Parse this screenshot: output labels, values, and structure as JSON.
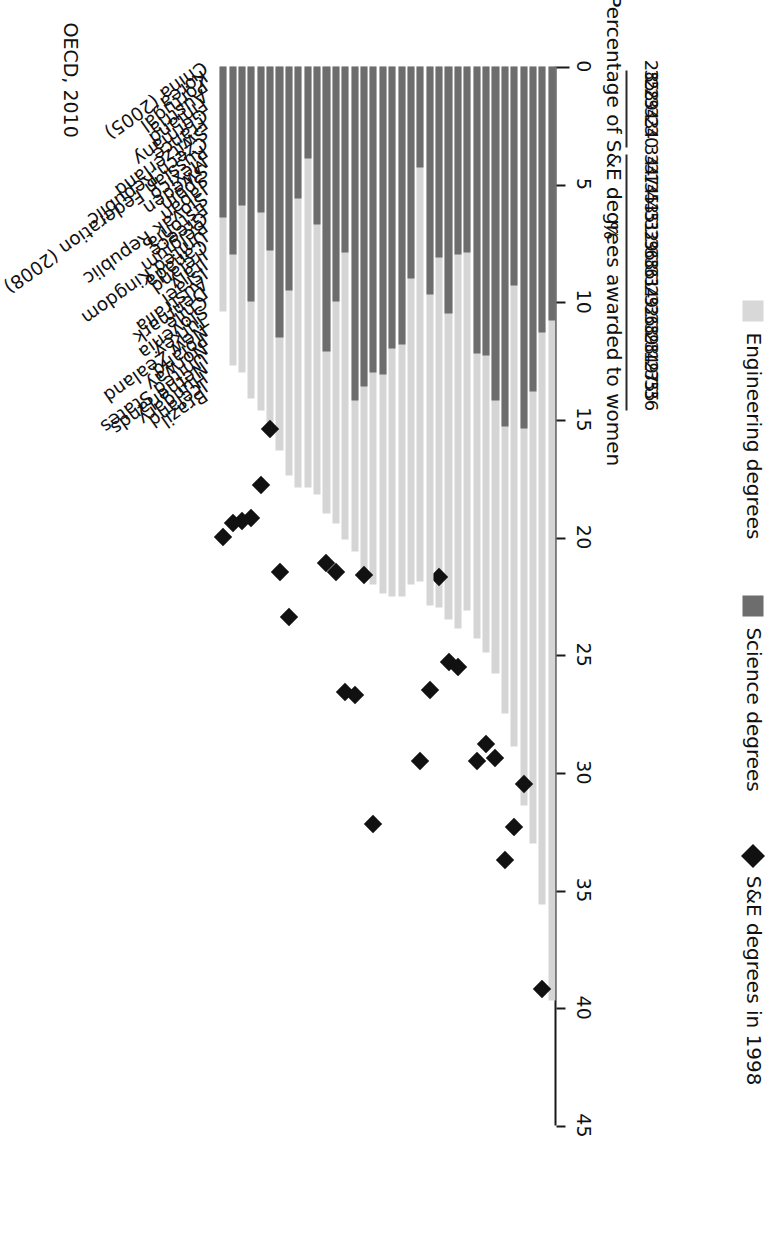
{
  "figure": {
    "axis_unit_label": "%",
    "axis_title": "Percentage of S&E degrees awarded to women",
    "source": "OECD, 2010",
    "legend": [
      {
        "key": "engineering",
        "label": "Engineering degrees",
        "swatch": "light-gray-square",
        "color": "#d8d8d8"
      },
      {
        "key": "science",
        "label": "Science degrees",
        "swatch": "dark-gray-square",
        "color": "#6d6d6d"
      },
      {
        "key": "se1998",
        "label": "S&E degrees in 1998",
        "swatch": "black-diamond",
        "color": "#111111"
      }
    ]
  },
  "chart_data": {
    "type": "bar",
    "orientation": "horizontal-stacked",
    "title": "",
    "xlabel": "Percentage of S&E degrees awarded to women",
    "ylabel": "",
    "xlim": [
      0,
      45
    ],
    "xticks": [
      0,
      5,
      10,
      15,
      20,
      25,
      30,
      35,
      40,
      45
    ],
    "grid": false,
    "legend_position": "right",
    "categories": [
      "China (2005)",
      "Korea",
      "Portugal",
      "Austria",
      "Finland",
      "Germany",
      "France",
      "Switzerland",
      "Czech Republic",
      "Russian Federation (2008)",
      "Mexico",
      "Sweden",
      "Spain",
      "Japan",
      "Slovak Republic",
      "Estonia",
      "Greece",
      "Belgium",
      "United Kingdom",
      "Canada",
      "Ireland",
      "Italy",
      "Israel",
      "Australia",
      "Denmark",
      "Chile",
      "Slovenia",
      "Turkey",
      "New Zealand",
      "Poland",
      "Norway",
      "United States",
      "Netherlands",
      "Hungary",
      "Iceland",
      "Brazil"
    ],
    "series": [
      {
        "name": "Science degrees",
        "color": "#6d6d6d",
        "values": [
          10.8,
          11.3,
          13.8,
          15.4,
          9.3,
          15.3,
          14.2,
          12.3,
          12.2,
          7.9,
          8.0,
          10.5,
          8.1,
          9.7,
          4.3,
          9.0,
          11.8,
          12.0,
          13.1,
          13.0,
          13.6,
          14.2,
          7.9,
          10.0,
          12.1,
          6.7,
          3.9,
          5.6,
          9.5,
          11.5,
          7.8,
          6.2,
          10.0,
          5.9,
          8.0,
          6.4
        ]
      },
      {
        "name": "Engineering degrees",
        "color": "#d5d5d5",
        "values": [
          28.9,
          24.3,
          19.2,
          16.0,
          19.6,
          12.2,
          11.6,
          12.6,
          12.1,
          15.2,
          15.9,
          13.0,
          14.9,
          13.2,
          17.6,
          13.0,
          10.7,
          10.5,
          9.3,
          9.0,
          8.0,
          6.4,
          12.2,
          9.4,
          6.9,
          11.5,
          14.0,
          12.3,
          7.9,
          4.8,
          7.5,
          8.4,
          4.1,
          7.1,
          4.7,
          4.0
        ]
      }
    ],
    "markers": {
      "name": "S&E degrees in 1998",
      "color": "#111111",
      "shape": "diamond",
      "values": [
        null,
        39.2,
        null,
        30.5,
        32.3,
        33.7,
        29.4,
        28.8,
        29.5,
        null,
        25.5,
        25.3,
        21.7,
        26.5,
        29.5,
        null,
        null,
        null,
        null,
        32.2,
        21.6,
        26.7,
        26.6,
        21.5,
        21.1,
        null,
        null,
        null,
        23.4,
        21.5,
        15.4,
        17.8,
        19.2,
        19.3,
        19.4,
        20.0
      ]
    },
    "right_column": {
      "header": "S&E degrees in 1998 (%)",
      "values": [
        null,
        28,
        35,
        28,
        29,
        34,
        33,
        24,
        30,
        null,
        34,
        34,
        37,
        14,
        35,
        43,
        45,
        31,
        32,
        39,
        36,
        38,
        36,
        31,
        34,
        29,
        32,
        36,
        38,
        39,
        28,
        34,
        19,
        27,
        35,
        35,
        36
      ]
    }
  }
}
